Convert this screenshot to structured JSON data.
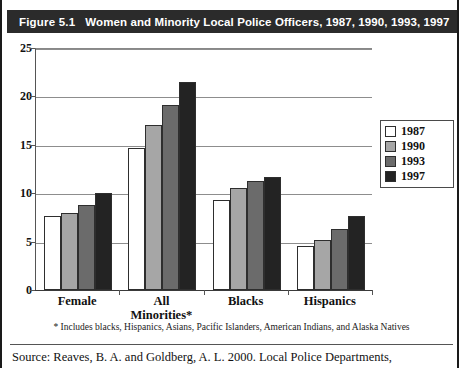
{
  "figure": {
    "number_label": "Figure 5.1",
    "title": "Women and Minority Local Police Officers, 1987, 1990, 1993, 1997",
    "footnote": "* Includes blacks, Hispanics, Asians, Pacific Islanders, American Indians, and Alaska Natives",
    "source": "Source: Reaves, B. A. and Goldberg, A. L. 2000. Local Police Departments,"
  },
  "colors": {
    "title_band_bg": "#2b2b2b",
    "title_band_text": "#ffffff",
    "series_1987": "#ffffff",
    "series_1990": "#a6a6a6",
    "series_1993": "#6b6b6b",
    "series_1997": "#232323",
    "gridline": "#8d8d8d",
    "axis": "#3a3a3a"
  },
  "legend": {
    "position": "right",
    "entries": [
      {
        "label": "1987",
        "color": "#ffffff"
      },
      {
        "label": "1990",
        "color": "#a6a6a6"
      },
      {
        "label": "1993",
        "color": "#6b6b6b"
      },
      {
        "label": "1997",
        "color": "#232323"
      }
    ]
  },
  "chart_data": {
    "type": "bar",
    "title": "Women and Minority Local Police Officers, 1987, 1990, 1993, 1997",
    "xlabel": "",
    "ylabel": "",
    "categories": [
      "Female",
      "All Minorities*",
      "Blacks",
      "Hispanics"
    ],
    "series": [
      {
        "name": "1987",
        "values": [
          7.6,
          14.7,
          9.3,
          4.5
        ]
      },
      {
        "name": "1990",
        "values": [
          8.0,
          17.0,
          10.5,
          5.2
        ]
      },
      {
        "name": "1993",
        "values": [
          8.8,
          19.1,
          11.3,
          6.3
        ]
      },
      {
        "name": "1997",
        "values": [
          10.0,
          21.5,
          11.7,
          7.6
        ]
      }
    ],
    "ylim": [
      0,
      25
    ],
    "yticks": [
      0,
      5,
      10,
      15,
      20,
      25
    ],
    "ytick_labels": [
      "0",
      "5",
      "10",
      "15",
      "20",
      "25"
    ],
    "grid": true,
    "legend_position": "right"
  },
  "category_label_lines": [
    [
      "Female"
    ],
    [
      "All",
      "Minorities*"
    ],
    [
      "Blacks"
    ],
    [
      "Hispanics"
    ]
  ]
}
